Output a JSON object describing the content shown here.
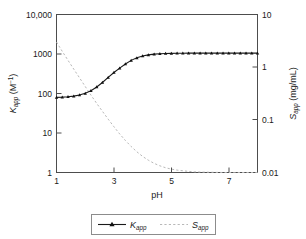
{
  "chart_data": {
    "type": "line",
    "title": "",
    "xlabel": "pH",
    "ylabel_left": "Kapp (M^-1)",
    "ylabel_right": "Sapp (mg/mL)",
    "x_ticks": [
      "1",
      "3",
      "5",
      "7"
    ],
    "x_tick_values": [
      1,
      3,
      5,
      7
    ],
    "xlim": [
      1,
      8
    ],
    "y_left_ticks": [
      "10,000",
      "1000",
      "100",
      "10",
      "1"
    ],
    "y_left_tick_values": [
      10000,
      1000,
      100,
      10,
      1
    ],
    "ylim_left": [
      1,
      10000
    ],
    "y_left_scale": "log",
    "y_right_ticks": [
      "10",
      "1",
      "0.1",
      "0.01"
    ],
    "y_right_tick_values": [
      10,
      1,
      0.1,
      0.01
    ],
    "ylim_right": [
      0.01,
      10
    ],
    "y_right_scale": "log",
    "grid": false,
    "legend_position": "bottom-center",
    "series": [
      {
        "name": "Kapp",
        "axis": "left",
        "style": "solid-with-markers",
        "marker": "triangle",
        "color": "#1a1a1a",
        "x": [
          1.0,
          1.2,
          1.4,
          1.6,
          1.8,
          2.0,
          2.2,
          2.4,
          2.6,
          2.8,
          3.0,
          3.2,
          3.4,
          3.6,
          3.8,
          4.0,
          4.2,
          4.4,
          4.6,
          4.8,
          5.0,
          5.2,
          5.4,
          5.6,
          5.8,
          6.0,
          6.2,
          6.4,
          6.6,
          6.8,
          7.0,
          7.2,
          7.4,
          7.6,
          7.8,
          8.0
        ],
        "y": [
          80,
          81,
          83,
          86,
          92,
          101,
          118,
          146,
          190,
          255,
          340,
          440,
          560,
          690,
          800,
          890,
          950,
          990,
          1015,
          1030,
          1040,
          1045,
          1048,
          1050,
          1051,
          1052,
          1052,
          1053,
          1053,
          1053,
          1054,
          1054,
          1054,
          1054,
          1055,
          1055
        ]
      },
      {
        "name": "Sapp",
        "axis": "right",
        "style": "dashed",
        "color": "#b8b8b8",
        "x": [
          1.0,
          1.2,
          1.4,
          1.6,
          1.8,
          2.0,
          2.2,
          2.4,
          2.6,
          2.8,
          3.0,
          3.2,
          3.4,
          3.6,
          3.8,
          4.0,
          4.2,
          4.4,
          4.6,
          4.8,
          5.0,
          5.2,
          5.4,
          5.6,
          5.8,
          6.0,
          6.4,
          6.8,
          7.2,
          7.6,
          8.0
        ],
        "y": [
          3.0,
          2.0,
          1.35,
          0.92,
          0.63,
          0.43,
          0.295,
          0.205,
          0.145,
          0.103,
          0.074,
          0.054,
          0.0405,
          0.0312,
          0.0247,
          0.0202,
          0.0171,
          0.0149,
          0.0134,
          0.0123,
          0.0116,
          0.0111,
          0.0108,
          0.0105,
          0.0103,
          0.0102,
          0.0101,
          0.01,
          0.01,
          0.01,
          0.01
        ]
      }
    ],
    "legend": [
      {
        "label": "Kapp",
        "style": "solid-with-markers"
      },
      {
        "label": "Sapp",
        "style": "dashed"
      }
    ]
  },
  "labels": {
    "k_base": "K",
    "k_sub": "app",
    "k_units_open": " (M",
    "k_units_sup": "−1",
    "k_units_close": ")",
    "s_base": "S",
    "s_sub": "app",
    "s_units": " (mg/mL)",
    "x_title": "pH",
    "y_left_t0": "10,000",
    "y_left_t1": "1000",
    "y_left_t2": "100",
    "y_left_t3": "10",
    "y_left_t4": "1",
    "y_right_t0": "10",
    "y_right_t1": "1",
    "y_right_t2": "0.1",
    "y_right_t3": "0.01",
    "x_t0": "1",
    "x_t1": "3",
    "x_t2": "5",
    "x_t3": "7"
  }
}
